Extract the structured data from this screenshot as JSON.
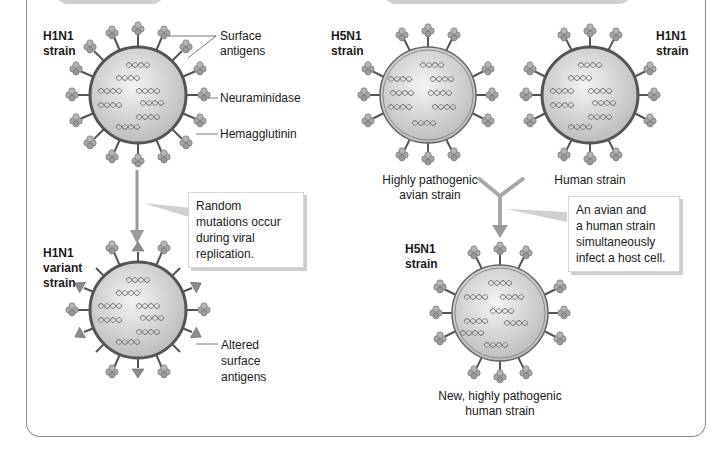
{
  "panels": {
    "left": {
      "top_strain": {
        "name": "H1N1",
        "suffix": "strain"
      },
      "annotations": {
        "surface_antigens": "Surface antigens",
        "neuraminidase": "Neuraminidase",
        "hemagglutinin": "Hemagglutinin"
      },
      "callout": "Random mutations occur during viral replication.",
      "bottom_strain": {
        "name": "H1N1",
        "line2": "variant",
        "line3": "strain"
      },
      "altered_label": {
        "line1": "Altered",
        "line2": "surface",
        "line3": "antigens"
      }
    },
    "right": {
      "avian_strain": {
        "name": "H5N1",
        "suffix": "strain",
        "caption_line1": "Highly pathogenic",
        "caption_line2": "avian strain"
      },
      "human_strain": {
        "name": "H1N1",
        "suffix": "strain",
        "caption": "Human strain"
      },
      "callout": {
        "line1": "An avian and",
        "line2": "a human strain",
        "line3": "simultaneously",
        "line4": "infect a host cell."
      },
      "result_strain": {
        "name": "H5N1",
        "suffix": "strain",
        "caption_line1": "New, highly pathogenic",
        "caption_line2": "human strain"
      }
    }
  },
  "colors": {
    "frame": "#8a8a8a",
    "virus_fill": "#d9d9d9",
    "virus_stroke": "#555555",
    "arrow": "#9a9a9a",
    "callout_shadow": "#cdcdcd"
  }
}
